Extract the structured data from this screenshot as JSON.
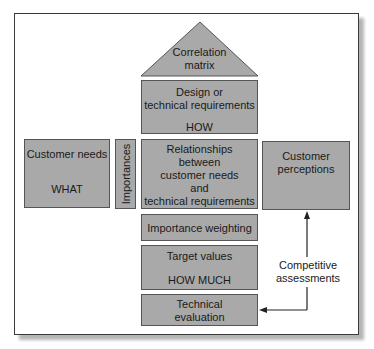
{
  "diagram": {
    "colors": {
      "box_fill": "#a9a9a9",
      "box_border": "#555555",
      "frame_border": "#3a3a3a"
    },
    "roof": {
      "line1": "Correlation",
      "line2": "matrix"
    },
    "design": {
      "line1": "Design or",
      "line2": "technical requirements",
      "line3": "HOW"
    },
    "customer_needs": {
      "line1": "Customer needs",
      "line2": "WHAT"
    },
    "importances": {
      "label": "Importances"
    },
    "relationships": {
      "line1": "Relationships",
      "line2": "between",
      "line3": "customer needs",
      "line4": "and",
      "line5": "technical requirements"
    },
    "customer_perceptions": {
      "line1": "Customer",
      "line2": "perceptions"
    },
    "importance_weighting": {
      "label": "Importance weighting"
    },
    "target_values": {
      "line1": "Target values",
      "line2": "HOW MUCH"
    },
    "technical_evaluation": {
      "line1": "Technical",
      "line2": "evaluation"
    },
    "competitive": {
      "line1": "Competitive",
      "line2": "assessments"
    }
  }
}
